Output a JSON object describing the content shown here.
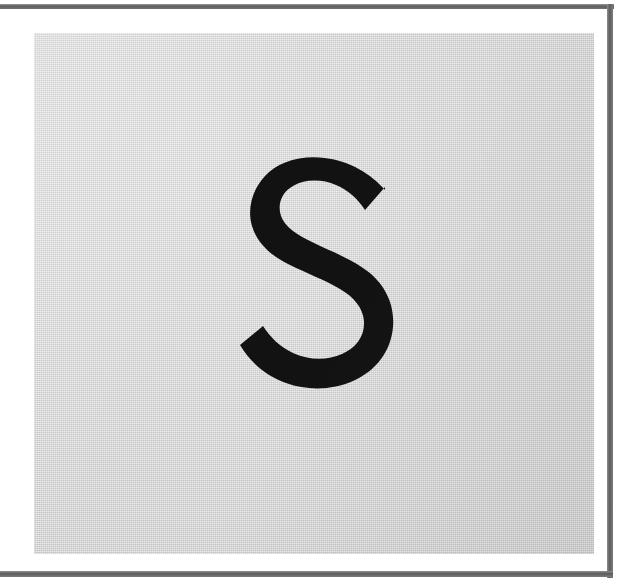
{
  "page": {
    "kind": "scanned-document-page",
    "background_color": "#ffffff",
    "width": 623,
    "height": 583
  },
  "frame": {
    "rule_color": "#5f5f5f",
    "rules": [
      {
        "name": "top-rule",
        "edge": "top"
      },
      {
        "name": "right-rule",
        "edge": "right"
      },
      {
        "name": "bottom-rule",
        "edge": "bottom"
      }
    ]
  },
  "card": {
    "name": "photographed-card",
    "background_color": "#d9d9d9",
    "texture": "paper-weave"
  },
  "glyph": {
    "character": "S",
    "case": "uppercase",
    "style": "sans-serif",
    "color": "#121212",
    "label": "letter-s"
  }
}
